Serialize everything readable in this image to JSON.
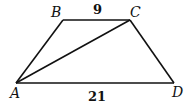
{
  "diagram": {
    "type": "trapezoid",
    "vertices": [
      {
        "name": "A",
        "label": "A",
        "x": 16,
        "y": 83
      },
      {
        "name": "B",
        "label": "B",
        "x": 63,
        "y": 20
      },
      {
        "name": "C",
        "label": "C",
        "x": 130,
        "y": 20
      },
      {
        "name": "D",
        "label": "D",
        "x": 174,
        "y": 83
      }
    ],
    "segments": [
      "AB",
      "BC",
      "CD",
      "DA",
      "AC"
    ],
    "measures": {
      "BC": "9",
      "AD": "21"
    }
  }
}
